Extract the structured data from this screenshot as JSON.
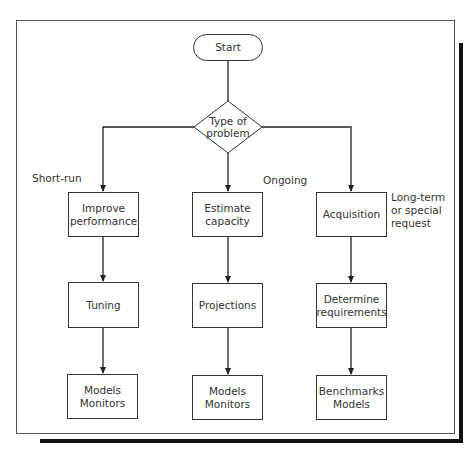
{
  "diagram": {
    "type": "flowchart",
    "start": {
      "label": "Start"
    },
    "decision": {
      "label": "Type of\nproblem"
    },
    "branches": [
      {
        "annotation": "Short-run",
        "steps": [
          {
            "label": "Improve\nperformance"
          },
          {
            "label": "Tuning"
          },
          {
            "label": "Models\nMonitors"
          }
        ]
      },
      {
        "annotation": "Ongoing",
        "steps": [
          {
            "label": "Estimate\ncapacity"
          },
          {
            "label": "Projections"
          },
          {
            "label": "Models\nMonitors"
          }
        ]
      },
      {
        "annotation": "Long-term\nor special\nrequest",
        "steps": [
          {
            "label": "Acquisition"
          },
          {
            "label": "Determine\nrequirements"
          },
          {
            "label": "Benchmarks\nModels"
          }
        ]
      }
    ],
    "colors": {
      "line": "#333333",
      "shadow": "#111111",
      "background": "#ffffff"
    }
  }
}
